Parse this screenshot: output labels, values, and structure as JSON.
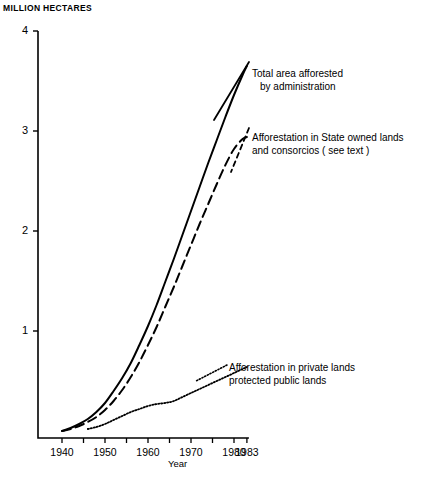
{
  "figure": {
    "y_axis_title": "MILLION HECTARES",
    "x_axis_name": "Year"
  },
  "annotations": {
    "total": {
      "line1": "Total area afforested",
      "line2": "by administration"
    },
    "state": {
      "line1": "Afforestation in State owned lands",
      "line2": "and consorcios ( see text )"
    },
    "private": {
      "line1": "Afforestation in private lands",
      "line2": "protected public lands"
    }
  },
  "chart_data": {
    "type": "line",
    "title": "",
    "xlabel": "Year",
    "ylabel": "MILLION HECTARES",
    "xlim": [
      1938,
      1983
    ],
    "ylim": [
      0,
      4
    ],
    "grid": false,
    "legend": "inline-annotations",
    "y_ticks": [
      1,
      2,
      3,
      4
    ],
    "y_tick_labels": [
      "1",
      "2",
      "3",
      "4"
    ],
    "x_ticks": [
      1940,
      1945,
      1950,
      1955,
      1960,
      1965,
      1970,
      1975,
      1980,
      1983
    ],
    "x_tick_labels": [
      "1940",
      "",
      "1950",
      "",
      "1960",
      "",
      "1970",
      "",
      "1980",
      "1983"
    ],
    "x_labeled_ticks": [
      {
        "year": 1940,
        "label": "1940"
      },
      {
        "year": 1950,
        "label": "1950"
      },
      {
        "year": 1960,
        "label": "1960"
      },
      {
        "year": 1970,
        "label": "1970"
      },
      {
        "year": 1980,
        "label": "1980"
      },
      {
        "year": 1983,
        "label": "1983"
      }
    ],
    "series": [
      {
        "name": "Total area afforested by administration",
        "style": "solid",
        "x": [
          1940,
          1942,
          1944,
          1946,
          1948,
          1950,
          1952,
          1954,
          1956,
          1958,
          1960,
          1962,
          1964,
          1966,
          1968,
          1970,
          1972,
          1974,
          1976,
          1978,
          1980,
          1982,
          1983
        ],
        "values": [
          0.0,
          0.03,
          0.07,
          0.12,
          0.19,
          0.28,
          0.4,
          0.53,
          0.68,
          0.86,
          1.05,
          1.26,
          1.49,
          1.72,
          1.96,
          2.2,
          2.44,
          2.68,
          2.91,
          3.14,
          3.36,
          3.56,
          3.65
        ]
      },
      {
        "name": "Afforestation in State owned lands and consorcios ( see text )",
        "style": "dashed",
        "x": [
          1940,
          1942,
          1944,
          1946,
          1948,
          1950,
          1952,
          1954,
          1956,
          1958,
          1960,
          1962,
          1964,
          1966,
          1968,
          1970,
          1972,
          1974,
          1976,
          1978,
          1980,
          1982,
          1983
        ],
        "values": [
          0.0,
          0.02,
          0.05,
          0.09,
          0.14,
          0.21,
          0.3,
          0.41,
          0.54,
          0.69,
          0.86,
          1.04,
          1.24,
          1.44,
          1.65,
          1.86,
          2.07,
          2.27,
          2.47,
          2.66,
          2.82,
          2.92,
          2.94
        ]
      },
      {
        "name": "Afforestation in private lands protected public lands",
        "style": "dotted",
        "x": [
          1946,
          1948,
          1950,
          1952,
          1954,
          1956,
          1958,
          1960,
          1962,
          1964,
          1966,
          1968,
          1970,
          1972,
          1974,
          1976,
          1978,
          1980,
          1982,
          1983
        ],
        "values": [
          0.02,
          0.04,
          0.07,
          0.11,
          0.15,
          0.19,
          0.22,
          0.25,
          0.27,
          0.28,
          0.3,
          0.34,
          0.38,
          0.42,
          0.46,
          0.5,
          0.54,
          0.58,
          0.62,
          0.64
        ]
      }
    ]
  },
  "colors": {
    "ink": "#000000",
    "background": "#ffffff"
  }
}
